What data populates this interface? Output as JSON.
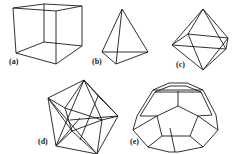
{
  "figure": {
    "panels": [
      {
        "id": "a",
        "label": "(a)",
        "shape": "cube"
      },
      {
        "id": "b",
        "label": "(b)",
        "shape": "tetrahedron"
      },
      {
        "id": "c",
        "label": "(c)",
        "shape": "octahedron"
      },
      {
        "id": "d",
        "label": "(d)",
        "shape": "icosahedron"
      },
      {
        "id": "e",
        "label": "(e)",
        "shape": "dodecahedron"
      }
    ],
    "colors": {
      "line": "#1a1a1a",
      "background": "#ffffff"
    }
  }
}
